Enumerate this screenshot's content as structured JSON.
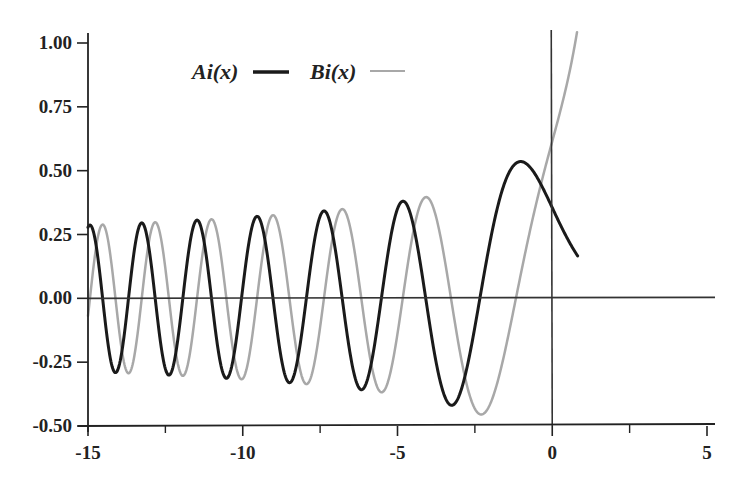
{
  "chart_data": {
    "type": "line",
    "title": "",
    "xlabel": "",
    "ylabel": "",
    "xlim": [
      -15,
      5
    ],
    "ylim": [
      -0.5,
      1.0
    ],
    "grid": false,
    "legend_position": "top-left inside",
    "x_ticks": [
      -15,
      -10,
      -5,
      0,
      5
    ],
    "x_tick_labels": [
      "-15",
      "-10",
      "-5",
      "0",
      "5"
    ],
    "x_minor_ticks": [
      -12.5,
      -7.5,
      -2.5,
      2.5
    ],
    "y_ticks": [
      -0.5,
      -0.25,
      0.0,
      0.25,
      0.5,
      0.75,
      1.0
    ],
    "y_tick_labels": [
      "-0.50",
      "-0.25",
      "0.00",
      "0.25",
      "0.50",
      "0.75",
      "1.00"
    ],
    "reference_lines": {
      "horizontal_y": 0,
      "vertical_x": 0
    },
    "sampling": {
      "x_start": -15,
      "x_end": 5,
      "step": 0.02
    },
    "series": [
      {
        "name": "Ai(x)",
        "function": "Airy Ai",
        "color": "#1a1a1a",
        "line_width": 3,
        "key_points": {
          "value_at_0": 0.355,
          "max": {
            "x": -1.02,
            "y": 0.536
          },
          "min": {
            "x": -3.25,
            "y": -0.419
          },
          "zeros": [
            -2.34,
            -4.09,
            -5.52,
            -6.79,
            -7.94,
            -9.02,
            -10.04,
            -11.01,
            -11.94,
            -12.83,
            -13.69,
            -14.53
          ],
          "near_zero_from": 3.0
        }
      },
      {
        "name": "Bi(x)",
        "function": "Airy Bi",
        "color": "#a8a8a8",
        "line_width": 2.5,
        "key_points": {
          "value_at_0": 0.615,
          "min": {
            "x": -2.29,
            "y": -0.455
          },
          "max": {
            "x": -4.07,
            "y": 0.398
          },
          "exceeds_ylim_at_x": 0.82,
          "zeros": [
            -1.17,
            -3.27,
            -4.83,
            -6.17,
            -7.38,
            -8.49,
            -9.53,
            -10.53,
            -11.48,
            -12.38,
            -13.26,
            -14.11,
            -14.93
          ]
        }
      }
    ]
  },
  "legend": {
    "items": [
      {
        "label": "Ai(x)",
        "color": "#1a1a1a"
      },
      {
        "label": "Bi(x)",
        "color": "#a8a8a8"
      }
    ]
  }
}
